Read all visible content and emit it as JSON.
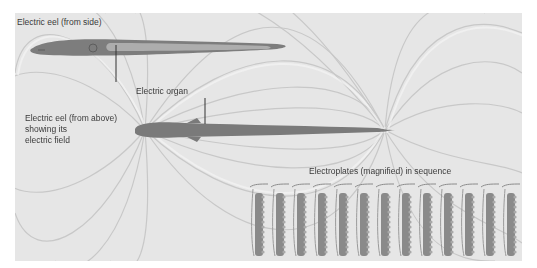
{
  "figure": {
    "labels": {
      "eel_side": "Electric eel (from side)",
      "electric_organ": "Electric organ",
      "eel_above_line1": "Electric eel (from above)",
      "eel_above_line2": "showing its",
      "eel_above_line3": "electric field",
      "electroplates": "Electroplates (magnified) in sequence"
    },
    "electroplate_count": 13,
    "colors": {
      "background": "#e6e6e6",
      "field_line": "#c9c9c9",
      "eel_body": "#7d7d7d",
      "electric_organ": "#adadad",
      "plate": "#8a8a8a",
      "plate_inner": "#a9a9a9"
    }
  }
}
